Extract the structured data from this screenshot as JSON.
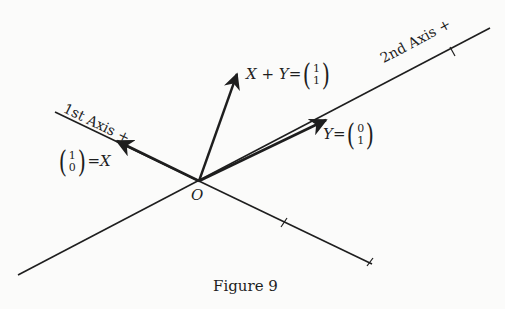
{
  "figure": {
    "caption": "Figure 9",
    "origin_label": "O",
    "axes": {
      "first": {
        "label": "1st Axis +"
      },
      "second": {
        "label": "2nd Axis +"
      }
    },
    "vectors": {
      "x": {
        "name": "X",
        "eq": "=",
        "top": "1",
        "bottom": "0"
      },
      "y": {
        "name": "Y",
        "eq": "=",
        "top": "0",
        "bottom": "1"
      },
      "sum": {
        "name": "X + Y",
        "eq": "=",
        "top": "1",
        "bottom": "1"
      }
    },
    "colors": {
      "ink": "#1e1e1e",
      "background": "#fbfbfa"
    }
  }
}
